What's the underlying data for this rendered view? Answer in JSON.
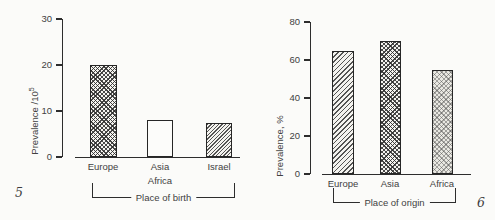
{
  "figure_numbers": {
    "left": "5",
    "right": "6"
  },
  "chart_data": [
    {
      "type": "bar",
      "title": "",
      "ylabel": "Prevalence /10",
      "ylabel_sup": "5",
      "xlabel": "Place of birth",
      "categories": [
        "Europe",
        "Asia Africa",
        "Israel"
      ],
      "category_lines": [
        [
          "Europe"
        ],
        [
          "Asia",
          "Africa"
        ],
        [
          "Israel"
        ]
      ],
      "values": [
        20,
        8,
        7.5
      ],
      "yticks": [
        0,
        10,
        20,
        30
      ],
      "ylim": [
        0,
        30
      ],
      "grid": false,
      "legend": "none",
      "bar_patterns": [
        "crosshatch",
        "plain",
        "diagonal-fine"
      ]
    },
    {
      "type": "bar",
      "title": "",
      "ylabel": "Prevalence, %",
      "xlabel": "Place of origin",
      "categories": [
        "Europe",
        "Asia",
        "Africa"
      ],
      "category_lines": [
        [
          "Europe"
        ],
        [
          "Asia"
        ],
        [
          "Africa"
        ]
      ],
      "values": [
        65,
        70,
        55
      ],
      "yticks": [
        0,
        20,
        40,
        60,
        80
      ],
      "ylim": [
        0,
        80
      ],
      "grid": false,
      "legend": "none",
      "bar_patterns": [
        "diagonal",
        "crosshatch",
        "checker-light"
      ]
    }
  ]
}
